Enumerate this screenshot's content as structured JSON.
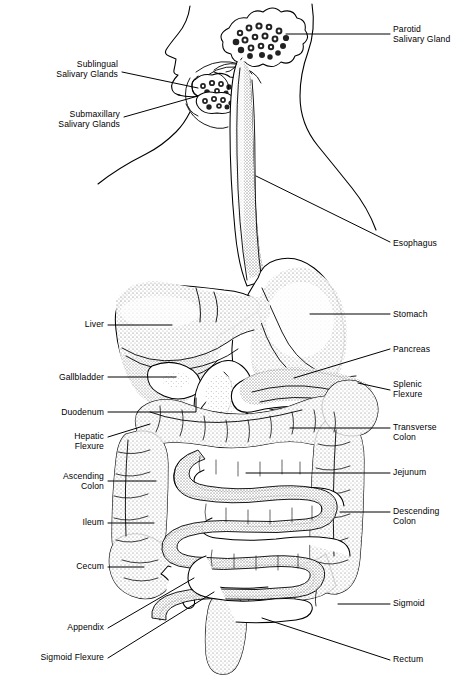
{
  "diagram": {
    "style": "black-and-white stippled line engraving",
    "background_color": "#ffffff",
    "ink_color": "#000000"
  },
  "labels": [
    {
      "id": "parotid-salivary-gland",
      "text": "Parotid\nSalivary Gland",
      "side": "right",
      "x": 393,
      "y": 24,
      "anchor_x": 251,
      "anchor_y": 37
    },
    {
      "id": "sublingual-salivary-glands",
      "text": "Sublingual\nSalivary Glands",
      "side": "right-aligned-left",
      "x": 16,
      "y": 59,
      "anchor_x": 196,
      "anchor_y": 88
    },
    {
      "id": "submaxillary-salivary-glands",
      "text": "Submaxillary\nSalivary Glands",
      "side": "right-aligned-left",
      "x": 16,
      "y": 109,
      "anchor_x": 196,
      "anchor_y": 95
    },
    {
      "id": "esophagus",
      "text": "Esophagus",
      "side": "right",
      "x": 393,
      "y": 238,
      "anchor_x": 255,
      "anchor_y": 173
    },
    {
      "id": "liver",
      "text": "Liver",
      "side": "right-aligned-left",
      "x": 66,
      "y": 319,
      "anchor_x": 170,
      "anchor_y": 325
    },
    {
      "id": "stomach",
      "text": "Stomach",
      "side": "right",
      "x": 393,
      "y": 310,
      "anchor_x": 314,
      "anchor_y": 314
    },
    {
      "id": "pancreas",
      "text": "Pancreas",
      "side": "right",
      "x": 393,
      "y": 345,
      "anchor_x": 292,
      "anchor_y": 379
    },
    {
      "id": "gallbladder",
      "text": "Gallbladder",
      "side": "right-aligned-left",
      "x": 31,
      "y": 372,
      "anchor_x": 173,
      "anchor_y": 374
    },
    {
      "id": "splenic-flexure",
      "text": "Splenic\nFlexure",
      "side": "right",
      "x": 393,
      "y": 380,
      "anchor_x": 355,
      "anchor_y": 390
    },
    {
      "id": "duodenum",
      "text": "Duodenum",
      "side": "right-aligned-left",
      "x": 38,
      "y": 407,
      "anchor_x": 196,
      "anchor_y": 395
    },
    {
      "id": "transverse-colon",
      "text": "Transverse\nColon",
      "side": "right",
      "x": 393,
      "y": 423,
      "anchor_x": 290,
      "anchor_y": 433
    },
    {
      "id": "hepatic-flexure",
      "text": "Hepatic\nFlexure",
      "side": "right-aligned-left",
      "x": 52,
      "y": 432,
      "anchor_x": 148,
      "anchor_y": 425
    },
    {
      "id": "jejunum",
      "text": "Jejunum",
      "side": "right",
      "x": 393,
      "y": 468,
      "anchor_x": 245,
      "anchor_y": 478
    },
    {
      "id": "ascending-colon",
      "text": "Ascending\nColon",
      "side": "right-aligned-left",
      "x": 38,
      "y": 473,
      "anchor_x": 155,
      "anchor_y": 481
    },
    {
      "id": "descending-colon",
      "text": "Descending\nColon",
      "side": "right",
      "x": 393,
      "y": 507,
      "anchor_x": 339,
      "anchor_y": 516
    },
    {
      "id": "ileum",
      "text": "Ileum",
      "side": "right-aligned-left",
      "x": 66,
      "y": 517,
      "anchor_x": 152,
      "anchor_y": 523
    },
    {
      "id": "cecum",
      "text": "Cecum",
      "side": "right-aligned-left",
      "x": 58,
      "y": 562,
      "anchor_x": 143,
      "anchor_y": 566
    },
    {
      "id": "sigmoid",
      "text": "Sigmoid",
      "side": "right",
      "x": 393,
      "y": 600,
      "anchor_x": 338,
      "anchor_y": 604
    },
    {
      "id": "appendix",
      "text": "Appendix",
      "side": "right-aligned-left",
      "x": 50,
      "y": 623,
      "anchor_x": 193,
      "anchor_y": 578
    },
    {
      "id": "sigmoid-flexure",
      "text": "Sigmoid Flexure",
      "side": "right-aligned-left",
      "x": 14,
      "y": 652,
      "anchor_x": 213,
      "anchor_y": 591
    },
    {
      "id": "rectum",
      "text": "Rectum",
      "side": "right",
      "x": 393,
      "y": 655,
      "anchor_x": 265,
      "anchor_y": 617
    }
  ],
  "organs": [
    {
      "id": "head-profile",
      "name": "Head and neck body outline"
    },
    {
      "id": "parotid-gland",
      "name": "Parotid salivary gland"
    },
    {
      "id": "sublingual-gland",
      "name": "Sublingual salivary gland"
    },
    {
      "id": "submaxillary-gland",
      "name": "Submaxillary salivary gland"
    },
    {
      "id": "esophagus-tube",
      "name": "Esophagus"
    },
    {
      "id": "stomach-body",
      "name": "Stomach"
    },
    {
      "id": "liver-body",
      "name": "Liver"
    },
    {
      "id": "gallbladder-body",
      "name": "Gallbladder"
    },
    {
      "id": "duodenum-loop",
      "name": "Duodenum"
    },
    {
      "id": "pancreas-body",
      "name": "Pancreas"
    },
    {
      "id": "transverse-colon-seg",
      "name": "Transverse colon"
    },
    {
      "id": "hepatic-flexure-seg",
      "name": "Hepatic flexure"
    },
    {
      "id": "splenic-flexure-seg",
      "name": "Splenic flexure"
    },
    {
      "id": "ascending-colon-seg",
      "name": "Ascending colon"
    },
    {
      "id": "descending-colon-seg",
      "name": "Descending colon"
    },
    {
      "id": "jejunum-coils",
      "name": "Jejunum"
    },
    {
      "id": "ileum-coils",
      "name": "Ileum"
    },
    {
      "id": "cecum-body",
      "name": "Cecum"
    },
    {
      "id": "appendix-body",
      "name": "Vermiform appendix"
    },
    {
      "id": "sigmoid-colon-seg",
      "name": "Sigmoid colon"
    },
    {
      "id": "rectum-body",
      "name": "Rectum"
    }
  ]
}
